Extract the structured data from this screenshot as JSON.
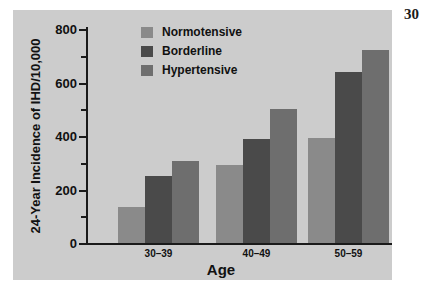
{
  "page_number": "30",
  "chart_data": {
    "type": "bar",
    "title": "",
    "xlabel": "Age",
    "ylabel": "24-Year Incidence of IHD/10,000",
    "categories": [
      "30–39",
      "40–49",
      "50–59"
    ],
    "series": [
      {
        "name": "Normotensive",
        "color": "#8a8a8a",
        "values": [
          135,
          290,
          392
        ]
      },
      {
        "name": "Borderline",
        "color": "#4a4a4a",
        "values": [
          250,
          388,
          638
        ]
      },
      {
        "name": "Hypertensive",
        "color": "#6e6e6e",
        "values": [
          305,
          500,
          720
        ]
      }
    ],
    "ylim": [
      0,
      800
    ],
    "ytick_major": [
      0,
      200,
      400,
      600,
      800
    ],
    "ytick_minor": [
      100,
      300,
      500,
      700
    ],
    "ytick_labels": [
      "0",
      "200",
      "400",
      "600",
      "800"
    ],
    "grid": false,
    "legend_position": "top-center",
    "figure_background": "#cccccc",
    "axis_color": "#1a1a1a"
  }
}
